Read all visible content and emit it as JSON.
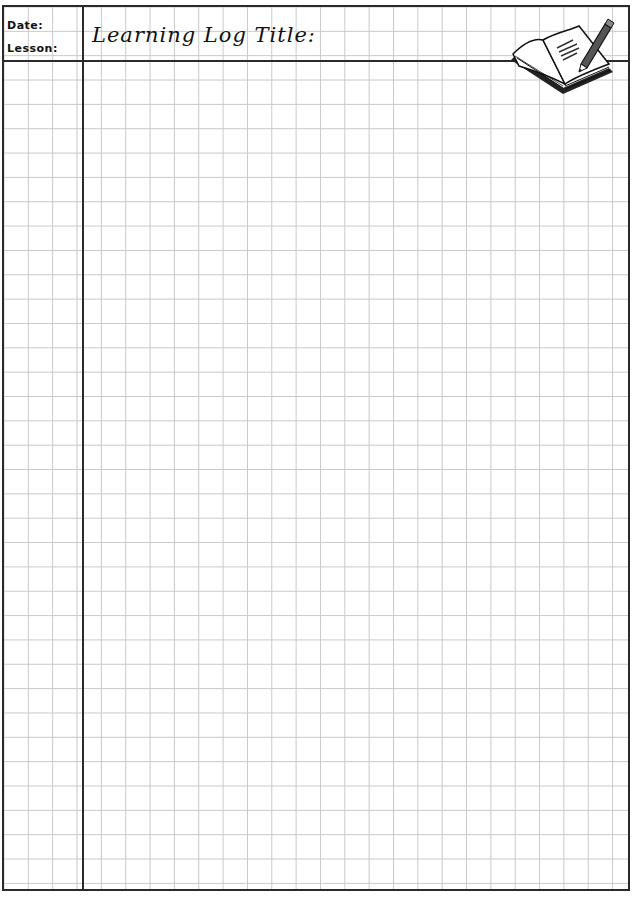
{
  "header": {
    "date_label": "Date:",
    "lesson_label": "Lesson:",
    "title_label": "Learning Log Title:",
    "illustration": "book-and-pencil-icon"
  },
  "sheet": {
    "type": "grid-paper",
    "grid_color": "#c8c8c8",
    "border_color": "#2a2a2a"
  }
}
